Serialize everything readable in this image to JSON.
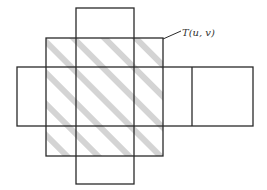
{
  "diagram": {
    "label": "T(u, v)",
    "colors": {
      "stroke": "#2a2a2a",
      "hatch": "#d4d4d4",
      "background": "#ffffff"
    },
    "shapes": {
      "vertical_rect": {
        "x": 76,
        "y": 8,
        "w": 58,
        "h": 176
      },
      "horizontal_rect": {
        "x": 17,
        "y": 67,
        "w": 236,
        "h": 59
      },
      "horizontal_divider_x": 192,
      "region_T": {
        "x": 46,
        "y": 38,
        "w": 117,
        "h": 118
      }
    }
  }
}
